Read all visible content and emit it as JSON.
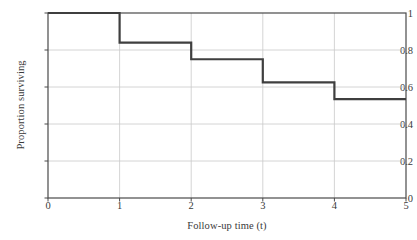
{
  "chart_data": {
    "type": "line",
    "subtype": "step-post",
    "title": "",
    "xlabel": "Follow-up time (t)",
    "ylabel": "Proportion surviving",
    "xlim": [
      0,
      5
    ],
    "ylim": [
      0,
      1
    ],
    "xticks": [
      0,
      1,
      2,
      3,
      4,
      5
    ],
    "xtick_labels": [
      "0",
      "1",
      "2",
      "3",
      "4",
      "5"
    ],
    "yticks": [
      0,
      0.2,
      0.4,
      0.6,
      0.8,
      1
    ],
    "ytick_labels": [
      "0",
      "0.2",
      "0.4",
      "0.6",
      "0.8",
      "1"
    ],
    "grid": true,
    "grid_axis": "both",
    "legend": false,
    "legend_position": "none",
    "series": [
      {
        "name": "Kaplan-Meier survival",
        "x": [
          0,
          1,
          2,
          3,
          4,
          5
        ],
        "values": [
          1.0,
          0.84,
          0.75,
          0.625,
          0.535,
          0.535
        ],
        "steps": [
          {
            "from": 0,
            "to": 1,
            "y": 1.0
          },
          {
            "from": 1,
            "to": 2,
            "y": 0.84
          },
          {
            "from": 2,
            "to": 3,
            "y": 0.75
          },
          {
            "from": 3,
            "to": 4,
            "y": 0.625
          },
          {
            "from": 4,
            "to": 5,
            "y": 0.535
          }
        ],
        "color": "#3f3f3f",
        "line_width": 2.2
      }
    ],
    "colors": {
      "background": "#ffffff",
      "axis": "#4a4a4a",
      "grid": "#c9c9c9",
      "text": "#3a3a3a",
      "curve": "#3f3f3f"
    }
  }
}
